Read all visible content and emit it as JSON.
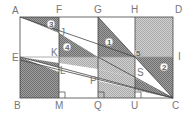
{
  "figure": {
    "title": "",
    "points": {
      "A": "A",
      "F": "F",
      "G": "G",
      "H": "H",
      "D": "D",
      "E": "E",
      "I": "I",
      "J": "J",
      "K": "K",
      "L": "L",
      "P": "P",
      "S": "S",
      "B": "B",
      "M": "M",
      "Q": "Q",
      "U": "U",
      "C": "C"
    },
    "region_numbers": [
      "1",
      "2",
      "3",
      "4",
      "5"
    ],
    "colors": {
      "outline": "#444444",
      "shade_dark": "#8a8a8a",
      "shade_light": "#c4c4c4",
      "label": "#777777"
    }
  }
}
